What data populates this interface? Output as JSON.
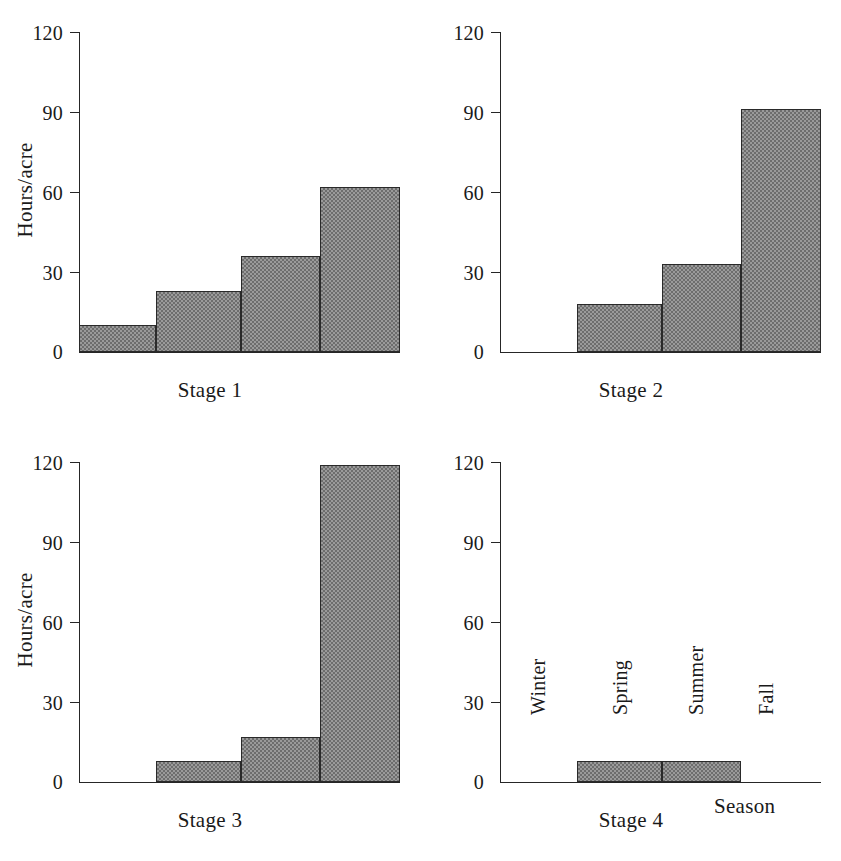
{
  "chart_data": {
    "type": "bar",
    "title": "",
    "xlabel": "Season",
    "ylabel": "Hours/acre",
    "categories": [
      "Winter",
      "Spring",
      "Summer",
      "Fall"
    ],
    "yticks": [
      0,
      30,
      60,
      90,
      120
    ],
    "ylim": [
      0,
      120
    ],
    "grid": false,
    "legend": null,
    "panels": [
      {
        "title": "Stage 1",
        "ylabel": "Hours/acre",
        "xlabel": "",
        "show_category_labels": false,
        "values": [
          10,
          23,
          36,
          62
        ]
      },
      {
        "title": "Stage 2",
        "ylabel": "",
        "xlabel": "",
        "show_category_labels": false,
        "values": [
          0,
          18,
          33,
          91
        ]
      },
      {
        "title": "Stage 3",
        "ylabel": "Hours/acre",
        "xlabel": "",
        "show_category_labels": false,
        "values": [
          0,
          8,
          17,
          119
        ]
      },
      {
        "title": "Stage 4",
        "ylabel": "",
        "xlabel": "Season",
        "show_category_labels": true,
        "values": [
          0,
          8,
          8,
          0
        ]
      }
    ],
    "bar_style": {
      "fill": "#9a9a9a",
      "pattern": "checkerboard-dither",
      "edge_color": "#2a2a2a"
    }
  },
  "axis": {
    "tick_0": "0",
    "tick_30": "30",
    "tick_60": "60",
    "tick_90": "90",
    "tick_120": "120"
  }
}
